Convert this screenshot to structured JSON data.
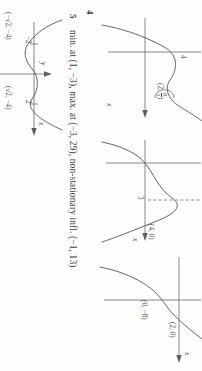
{
  "page": {
    "kind": "textbook-answers-scan",
    "orientation": "rotated-90-clockwise",
    "background": "#fefefe",
    "ink": "#545454"
  },
  "answers": [
    {
      "number": "4",
      "graphs": [
        {
          "id": "graph-4a",
          "axis_x_label": "x",
          "point_labels": [
            "4"
          ],
          "annotation": {
            "prefix": "(2, ",
            "num": "8",
            "den": "3",
            "suffix": ")"
          }
        },
        {
          "id": "graph-4b",
          "axis_x_label": "x",
          "tick_labels": [
            "3"
          ],
          "point_labels": [
            "(4, 0)"
          ]
        },
        {
          "id": "graph-4c",
          "axis_x_label": "x",
          "point_labels": [
            "(0, −8)",
            "(2, 0)"
          ]
        }
      ]
    },
    {
      "number": "5",
      "text": "min. at (1, −3), max. at (−3, 29), non-stationary infl. (−1, 13)",
      "graph": {
        "id": "graph-5",
        "axis_x_label": "x",
        "axis_y_label": "y",
        "tick_labels": [
          "−2",
          "2"
        ],
        "point_labels": [
          "(−√2, −4)",
          "(√2, −4)"
        ],
        "minima": [
          {
            "x": "−√2",
            "y": "−4"
          },
          {
            "x": "√2",
            "y": "−4"
          }
        ]
      }
    }
  ]
}
